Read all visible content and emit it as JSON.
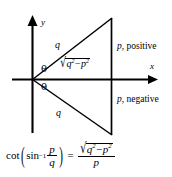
{
  "figure": {
    "background_color": "#ffffff",
    "ink_color": "#000000",
    "axes": {
      "x_label": "x",
      "y_label": "y",
      "x_arrow_icon": "arrow-right-icon",
      "y_arrow_icon": "arrow-up-icon"
    },
    "angles": {
      "upper_theta": "θ",
      "lower_theta": "θ"
    },
    "hypotenuse_labels": {
      "upper": "q",
      "lower": "q"
    },
    "base_label": {
      "radical_sign": "√",
      "radicand_first_var": "q",
      "radicand_first_exp": "2",
      "minus": "−",
      "radicand_second_var": "p",
      "radicand_second_exp": "2"
    },
    "side_labels": {
      "upper": {
        "variable": "p",
        "text": ", positive"
      },
      "lower": {
        "variable": "p",
        "text": ", negative"
      }
    }
  },
  "equation": {
    "cot": "cot",
    "open_paren": "(",
    "sin": "sin",
    "inverse_exponent": "−1",
    "arg_numerator": "p",
    "arg_denominator": "q",
    "close_paren": ")",
    "equals": "=",
    "result_radical_sign": "√",
    "result_radicand_first_var": "q",
    "result_radicand_first_exp": "2",
    "result_minus": "−",
    "result_radicand_second_var": "p",
    "result_radicand_second_exp": "2",
    "result_denominator": "p"
  }
}
